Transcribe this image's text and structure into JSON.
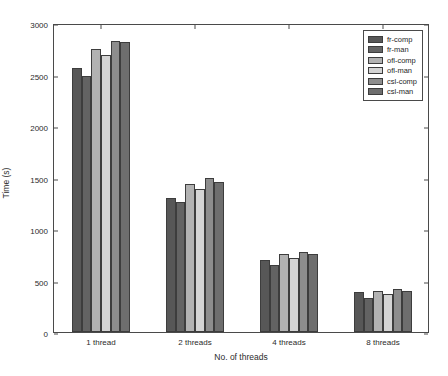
{
  "chart_data": {
    "type": "bar",
    "title": "",
    "xlabel": "No. of threads",
    "ylabel": "Time (s)",
    "categories": [
      "1 thread",
      "2 threads",
      "4 threads",
      "8 threads"
    ],
    "ylim": [
      0,
      3000
    ],
    "yticks": [
      0,
      500,
      1000,
      1500,
      2000,
      2500,
      3000
    ],
    "ytick_labels": [
      "0",
      "500",
      "1000",
      "1500",
      "2000",
      "2500",
      "3000"
    ],
    "grid": false,
    "legend_position": "top-right",
    "series": [
      {
        "name": "fr-comp",
        "color": "#575757",
        "values": [
          2560,
          1300,
          700,
          390
        ]
      },
      {
        "name": "fr-man",
        "color": "#636363",
        "values": [
          2490,
          1260,
          650,
          330
        ]
      },
      {
        "name": "ofl-comp",
        "color": "#b2b2b2",
        "values": [
          2750,
          1435,
          760,
          400
        ]
      },
      {
        "name": "ofl-man",
        "color": "#d4d4d4",
        "values": [
          2690,
          1385,
          720,
          370
        ]
      },
      {
        "name": "csl-comp",
        "color": "#8d8d8d",
        "values": [
          2830,
          1500,
          780,
          420
        ]
      },
      {
        "name": "csl-man",
        "color": "#6e6e6e",
        "values": [
          2820,
          1455,
          755,
          395
        ]
      }
    ]
  }
}
